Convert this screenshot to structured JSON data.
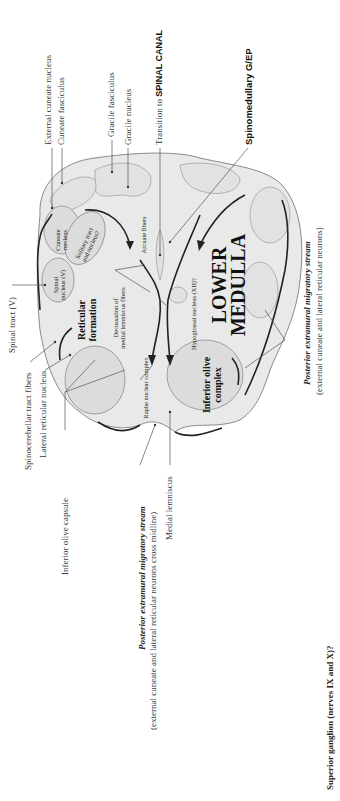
{
  "figure": {
    "title_large": "LOWER MEDULLA",
    "title_line1": "LOWER",
    "title_line2": "MEDULLA",
    "colors": {
      "background": "#ffffff",
      "tissue": "#e9e9e9",
      "ink": "#222222",
      "leader": "#555555"
    }
  },
  "labels_top": {
    "external_cuneate_nucleus": "External cuneate nucleus",
    "cuneate_fasciculus": "Cuneate fasciculus",
    "gracile_fasciculus": "Gracile fasciculus",
    "gracile_nucleus": "Gracile nucleus",
    "transition_prefix": "Transition to ",
    "transition_bold": "SPINAL CANAL",
    "spinomedullary": "Spinomedullary G/EP"
  },
  "labels_left": {
    "spinal_tract_v": "Spinal tract (V)",
    "spinocerebellar_tract_fibers": "Spinocerebellar tract fibers",
    "lateral_reticular_nucleus": "Lateral reticular nucleus",
    "inferior_olive_capsule": "Inferior olive capsule"
  },
  "labels_bottom": {
    "stream_left_title": "Posterior extramural migratory stream",
    "stream_left_sub": "(external cuneate and lateral reticular neurons cross midline)",
    "medial_lemniscus": "Medial lemniscus",
    "superior_ganglion": "Superior ganglion (nerves IX and X)?"
  },
  "labels_right": {
    "stream_right_title": "Posterior extramural migratory stream",
    "stream_right_sub": "(external cuneate and lateral reticular neurons)"
  },
  "labels_inner": {
    "cuneate_nucleus_1": "Cuneate",
    "cuneate_nucleus_2": "nucleus",
    "solitary_1": "Solitary tract",
    "solitary_2": "and nucleus?",
    "spinal_nucleus_1": "Spinal",
    "spinal_nucleus_2": "nucleus (V)",
    "reticular_1": "Reticular",
    "reticular_2": "formation",
    "decussation_1": "Decussation of",
    "decussation_2": "medial lemniscus fibers",
    "arcuate_fibers": "Arcuate fibers",
    "raphe": "Raphe nuclear complex",
    "hypoglossal": "Hypoglossal nucleus (XII)?",
    "inferior_olive_1": "Inferior olive",
    "inferior_olive_2": "complex"
  }
}
